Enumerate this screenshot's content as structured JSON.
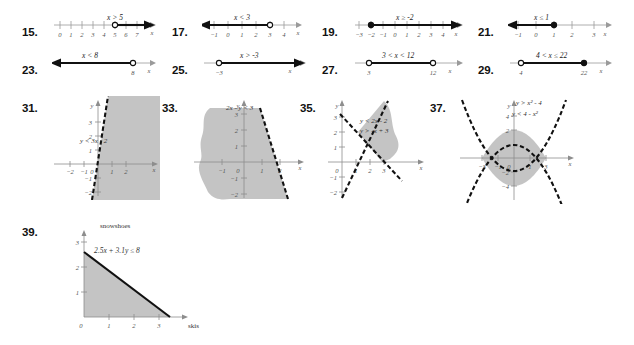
{
  "page": {
    "background_color": "#ffffff",
    "ink_color": "#1a1a1a",
    "shade_color": "#b3b3b3"
  },
  "number_line_problems": [
    {
      "number": "15.",
      "inequality": "x > 5",
      "ticks": [
        "0",
        "1",
        "2",
        "3",
        "4",
        "5",
        "6",
        "7"
      ],
      "axis_letter": "x",
      "endpoint_value": "5",
      "endpoint_type": "open",
      "direction": "right"
    },
    {
      "number": "17.",
      "inequality": "x < 3",
      "ticks": [
        "-1",
        "0",
        "1",
        "2",
        "3",
        "4"
      ],
      "axis_letter": "x",
      "endpoint_value": "3",
      "endpoint_type": "open",
      "direction": "left"
    },
    {
      "number": "19.",
      "inequality": "x ≥ -2",
      "ticks": [
        "-3",
        "-2",
        "-1",
        "0",
        "1",
        "2",
        "3",
        "4"
      ],
      "axis_letter": "x",
      "endpoint_value": "-2",
      "endpoint_type": "closed",
      "direction": "right"
    },
    {
      "number": "21.",
      "inequality": "x ≤ 1",
      "ticks": [
        "-1",
        "0",
        "1",
        "2",
        "3"
      ],
      "axis_letter": "x",
      "endpoint_value": "1",
      "endpoint_type": "closed",
      "direction": "left"
    },
    {
      "number": "23.",
      "inequality": "x < 8",
      "ticks": [
        "8"
      ],
      "axis_letter": "x",
      "endpoint_value": "8",
      "endpoint_type": "open",
      "direction": "left"
    },
    {
      "number": "25.",
      "inequality": "x > -3",
      "ticks": [
        "-3"
      ],
      "axis_letter": "x",
      "endpoint_value": "-3",
      "endpoint_type": "open",
      "direction": "right"
    },
    {
      "number": "27.",
      "inequality": "3 < x < 12",
      "ticks": [
        "3",
        "12"
      ],
      "axis_letter": "x",
      "left_endpoint_type": "open",
      "right_endpoint_type": "open",
      "direction": "segment"
    },
    {
      "number": "29.",
      "inequality": "4 < x ≤ 22",
      "ticks": [
        "4",
        "22"
      ],
      "axis_letter": "x",
      "left_endpoint_type": "open",
      "right_endpoint_type": "closed",
      "direction": "segment"
    }
  ],
  "graph_problems": [
    {
      "number": "31.",
      "labels": [
        "y < 3x - 2"
      ],
      "x_ticks": [
        "-2",
        "-1",
        "1",
        "2"
      ],
      "y_ticks": [
        "-2",
        "-1",
        "1",
        "2",
        "3"
      ],
      "x_axis_letter": "x",
      "y_axis_letter": "y",
      "origin_label": "0",
      "boundary_style": "dashed"
    },
    {
      "number": "33.",
      "labels": [
        "2x - y < 3"
      ],
      "x_ticks": [
        "-1",
        "1",
        "2"
      ],
      "y_ticks": [
        "-2",
        "-1",
        "1",
        "2",
        "3"
      ],
      "x_axis_letter": "x",
      "y_axis_letter": "y",
      "origin_label": "0",
      "boundary_style": "dashed"
    },
    {
      "number": "35.",
      "labels": [
        "y < 2x - 2",
        "y > -x + 3"
      ],
      "x_ticks": [
        "1",
        "2",
        "3"
      ],
      "y_ticks": [
        "-2",
        "-1",
        "1",
        "2",
        "3"
      ],
      "x_axis_letter": "x",
      "y_axis_letter": "y",
      "origin_label": "0",
      "boundary_style": "dashed"
    },
    {
      "number": "37.",
      "labels": [
        "y > x² - 4",
        "y < 4 - x²"
      ],
      "x_ticks": [
        "-3",
        "-1",
        "1",
        "3"
      ],
      "y_ticks": [
        "-4",
        "-2",
        "2",
        "4"
      ],
      "x_axis_letter": "x",
      "y_axis_letter": "y",
      "origin_label": "0",
      "boundary_style": "dashed"
    }
  ],
  "application_problem": {
    "number": "39.",
    "inequality": "2.5x + 3.1y ≤ 8",
    "y_axis_name": "snowshoes",
    "x_axis_name": "skis",
    "x_ticks": [
      "1",
      "2",
      "3"
    ],
    "y_ticks": [
      "1",
      "2",
      "3"
    ],
    "origin_label": "0",
    "boundary_style": "solid"
  }
}
